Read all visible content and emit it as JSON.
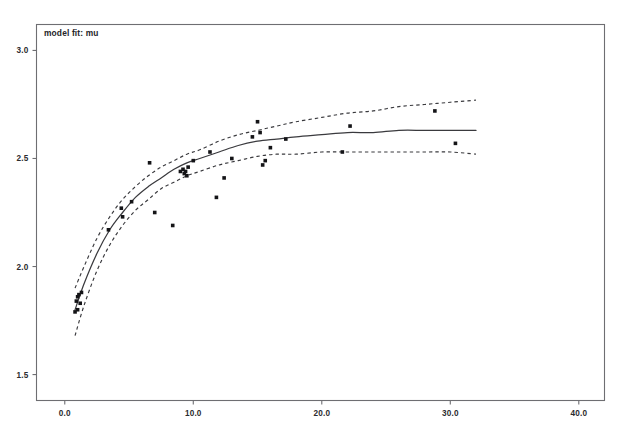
{
  "legend": {
    "label": "model fit: mu"
  },
  "chart_data": {
    "type": "scatter",
    "title": "",
    "subtitle": "",
    "xlabel": "",
    "ylabel": "",
    "xlim": [
      -2.2,
      42.0
    ],
    "ylim": [
      1.38,
      3.12
    ],
    "grid": false,
    "legend_position": "top-left",
    "legend_entries": [
      "model fit: mu"
    ],
    "xticks": [
      0.0,
      10.0,
      20.0,
      30.0,
      40.0
    ],
    "xticklabels": [
      "0.0",
      "10.0",
      "20.0",
      "30.0",
      "40.0"
    ],
    "yticks": [
      1.5,
      2.0,
      2.5,
      3.0
    ],
    "yticklabels": [
      "1.5",
      "2.0",
      "2.5",
      "3.0"
    ],
    "series": [
      {
        "name": "observations",
        "type": "scatter",
        "x": [
          0.8,
          0.9,
          1.0,
          1.0,
          1.1,
          1.2,
          1.3,
          3.4,
          4.4,
          4.5,
          5.2,
          6.6,
          7.0,
          8.4,
          9.0,
          9.2,
          9.3,
          9.4,
          9.5,
          9.6,
          10.0,
          11.3,
          11.8,
          12.4,
          13.0,
          14.6,
          15.0,
          15.2,
          15.4,
          15.6,
          16.0,
          17.2,
          21.6,
          22.2,
          28.8,
          30.4
        ],
        "y": [
          1.79,
          1.84,
          1.86,
          1.8,
          1.87,
          1.83,
          1.88,
          2.17,
          2.27,
          2.23,
          2.3,
          2.48,
          2.25,
          2.19,
          2.44,
          2.45,
          2.43,
          2.44,
          2.42,
          2.46,
          2.49,
          2.53,
          2.32,
          2.41,
          2.5,
          2.6,
          2.67,
          2.62,
          2.47,
          2.49,
          2.55,
          2.59,
          2.53,
          2.65,
          2.72,
          2.57
        ]
      },
      {
        "name": "fitted mean",
        "type": "line",
        "style": "solid",
        "x": [
          0.8,
          1.5,
          2.5,
          3.5,
          4.5,
          5.5,
          6.5,
          7.5,
          8.5,
          9.5,
          10.5,
          12.0,
          13.5,
          15.0,
          16.5,
          18.0,
          20.0,
          22.0,
          24.0,
          26.0,
          28.0,
          30.0,
          32.0
        ],
        "y": [
          1.8,
          1.92,
          2.06,
          2.17,
          2.25,
          2.32,
          2.37,
          2.41,
          2.45,
          2.48,
          2.5,
          2.53,
          2.56,
          2.58,
          2.59,
          2.6,
          2.61,
          2.62,
          2.62,
          2.63,
          2.63,
          2.63,
          2.63
        ]
      },
      {
        "name": "upper confidence band",
        "type": "line",
        "style": "dashed",
        "x": [
          0.8,
          1.5,
          2.5,
          3.5,
          4.5,
          5.5,
          6.5,
          7.5,
          8.5,
          9.5,
          10.5,
          12.0,
          13.5,
          15.0,
          16.5,
          18.0,
          20.0,
          22.0,
          24.0,
          26.0,
          28.0,
          30.0,
          32.0
        ],
        "y": [
          1.9,
          2.0,
          2.13,
          2.23,
          2.31,
          2.37,
          2.42,
          2.46,
          2.49,
          2.52,
          2.54,
          2.58,
          2.61,
          2.63,
          2.65,
          2.67,
          2.69,
          2.71,
          2.72,
          2.74,
          2.75,
          2.76,
          2.77
        ]
      },
      {
        "name": "lower confidence band",
        "type": "line",
        "style": "dashed",
        "x": [
          0.8,
          1.5,
          2.5,
          3.5,
          4.5,
          5.5,
          6.5,
          7.5,
          8.5,
          9.5,
          10.5,
          12.0,
          13.5,
          15.0,
          16.5,
          18.0,
          20.0,
          22.0,
          24.0,
          26.0,
          28.0,
          30.0,
          32.0
        ],
        "y": [
          1.68,
          1.82,
          1.98,
          2.1,
          2.19,
          2.26,
          2.31,
          2.36,
          2.39,
          2.42,
          2.44,
          2.47,
          2.49,
          2.51,
          2.52,
          2.52,
          2.53,
          2.53,
          2.53,
          2.53,
          2.53,
          2.53,
          2.52
        ]
      }
    ]
  }
}
